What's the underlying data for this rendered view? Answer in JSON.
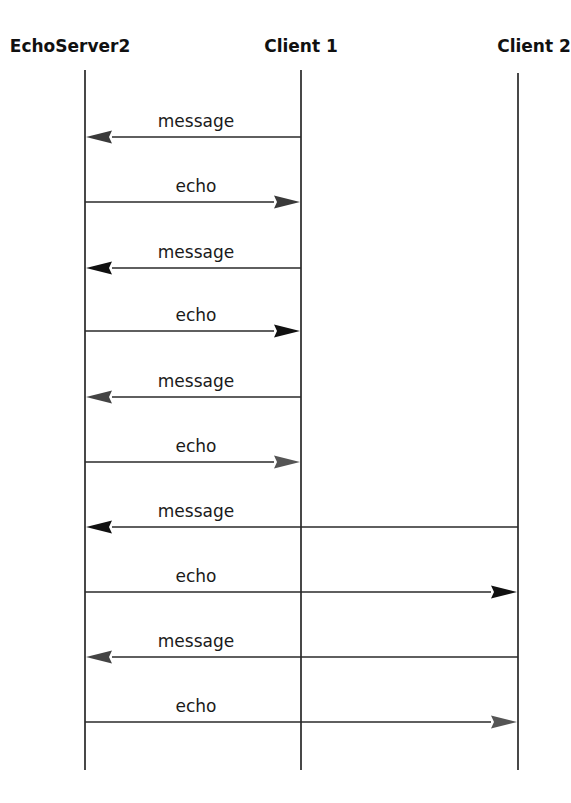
{
  "diagram": {
    "type": "sequence",
    "actors": [
      {
        "id": "server",
        "label": "EchoServer2",
        "x": 85,
        "label_x": 70,
        "top": 70
      },
      {
        "id": "client1",
        "label": "Client 1",
        "x": 301,
        "label_x": 301,
        "top": 70
      },
      {
        "id": "client2",
        "label": "Client 2",
        "x": 518,
        "label_x": 534,
        "top": 73
      }
    ],
    "lifeline_bottom": 770,
    "label_y": 52,
    "messages": [
      {
        "label": "message",
        "from": "client1",
        "to": "server",
        "y": 137,
        "head_color": "#3a3a3a"
      },
      {
        "label": "echo",
        "from": "server",
        "to": "client1",
        "y": 202,
        "head_color": "#3a3a3a"
      },
      {
        "label": "message",
        "from": "client1",
        "to": "server",
        "y": 268,
        "head_color": "#111111"
      },
      {
        "label": "echo",
        "from": "server",
        "to": "client1",
        "y": 331,
        "head_color": "#111111"
      },
      {
        "label": "message",
        "from": "client1",
        "to": "server",
        "y": 397,
        "head_color": "#444444"
      },
      {
        "label": "echo",
        "from": "server",
        "to": "client1",
        "y": 462,
        "head_color": "#555555"
      },
      {
        "label": "message",
        "from": "client2",
        "to": "server",
        "y": 527,
        "head_color": "#111111"
      },
      {
        "label": "echo",
        "from": "server",
        "to": "client2",
        "y": 592,
        "head_color": "#111111"
      },
      {
        "label": "message",
        "from": "client2",
        "to": "server",
        "y": 657,
        "head_color": "#444444"
      },
      {
        "label": "echo",
        "from": "server",
        "to": "client2",
        "y": 722,
        "head_color": "#555555"
      }
    ],
    "label_center_x": 196
  }
}
